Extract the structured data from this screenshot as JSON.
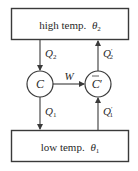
{
  "diagram": {
    "type": "heat-engine-refrigerator",
    "colors": {
      "stroke": "#3a3a3a",
      "text": "#2a2a2a",
      "background": "#ffffff"
    },
    "reservoirs": {
      "high": {
        "label": "high temp.",
        "symbol": "θ",
        "subscript": "2"
      },
      "low": {
        "label": "low temp.",
        "symbol": "θ",
        "subscript": "1"
      }
    },
    "engines": {
      "left": {
        "label": "C"
      },
      "right": {
        "label": "C",
        "bar": "̄",
        "prime": "′"
      }
    },
    "flows": {
      "q2": {
        "symbol": "Q",
        "subscript": "2",
        "prime": ""
      },
      "q2_prime": {
        "symbol": "Q",
        "subscript": "2",
        "prime": "′"
      },
      "q1": {
        "symbol": "Q",
        "subscript": "1",
        "prime": ""
      },
      "q1_prime": {
        "symbol": "Q",
        "subscript": "1",
        "prime": "′"
      },
      "work": {
        "symbol": "W"
      }
    }
  }
}
